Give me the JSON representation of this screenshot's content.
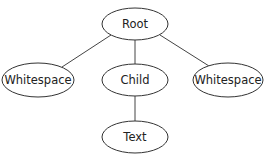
{
  "diagram": {
    "type": "tree",
    "nodes": [
      {
        "id": "root",
        "label": "Root",
        "cx": 135,
        "cy": 24,
        "rx": 33,
        "ry": 16
      },
      {
        "id": "ws-left",
        "label": "Whitespace",
        "cx": 38,
        "cy": 80,
        "rx": 36,
        "ry": 17
      },
      {
        "id": "child",
        "label": "Child",
        "cx": 135,
        "cy": 80,
        "rx": 33,
        "ry": 16
      },
      {
        "id": "ws-right",
        "label": "Whitespace",
        "cx": 228,
        "cy": 80,
        "rx": 35,
        "ry": 17
      },
      {
        "id": "text",
        "label": "Text",
        "cx": 135,
        "cy": 137,
        "rx": 33,
        "ry": 16
      }
    ],
    "edges": [
      {
        "from": "root",
        "to": "ws-left"
      },
      {
        "from": "root",
        "to": "child"
      },
      {
        "from": "root",
        "to": "ws-right"
      },
      {
        "from": "child",
        "to": "text"
      }
    ]
  }
}
